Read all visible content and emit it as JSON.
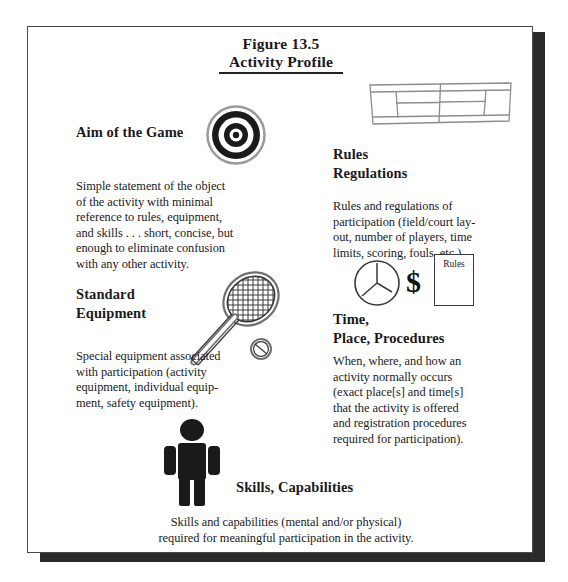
{
  "figure": {
    "number": "Figure 13.5",
    "title": "Activity Profile"
  },
  "sections": [
    {
      "id": "aim",
      "heading": "Aim of the Game",
      "icon": "bullseye-target-icon",
      "body": "Simple statement of the object\nof the activity with minimal\nreference to rules, equipment,\nand skills . . . short, concise, but\nenough to eliminate confusion\nwith any other activity."
    },
    {
      "id": "rules",
      "heading": "Rules\nRegulations",
      "icon": "tennis-court-diagram-icon",
      "body": "Rules and regulations of\nparticipation (field/court lay-\nout, number of players, time\nlimits, scoring, fouls, etc.)."
    },
    {
      "id": "equipment",
      "heading": "Standard\nEquipment",
      "icon": "tennis-racquet-icon",
      "body": "Special equipment associated\nwith participation (activity\nequipment, individual equip-\nment, safety equipment)."
    },
    {
      "id": "time",
      "heading": "Time,\nPlace, Procedures",
      "icon": "clock-dollar-document-icon",
      "document_label": "Rules",
      "body": "When, where, and how an\nactivity normally occurs\n(exact place[s] and time[s]\nthat the activity is offered\nand registration procedures\nrequired for participation)."
    },
    {
      "id": "skills",
      "heading": "Skills, Capabilities",
      "icon": "person-figure-icon",
      "body": "Skills and capabilities (mental and/or physical)\nrequired for meaningful participation in the activity."
    }
  ],
  "colors": {
    "ink": "#1a1a1a",
    "frame_border": "#4a4a4a",
    "shadow": "#2b2b2b",
    "icon_line": "#3a3a3a",
    "page_background": "#ffffff"
  }
}
